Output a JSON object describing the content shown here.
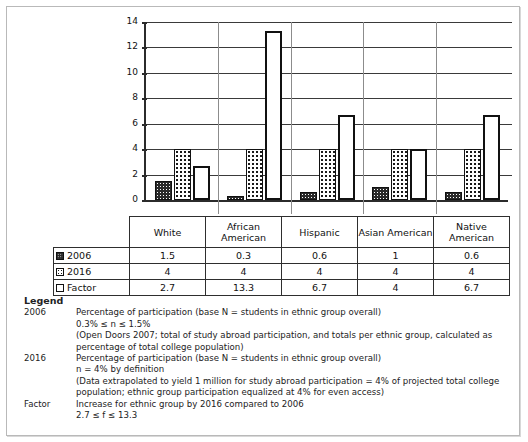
{
  "chart_data": {
    "type": "bar",
    "title": "",
    "xlabel": "",
    "ylabel": "",
    "ylim": [
      0,
      14
    ],
    "yticks": [
      0,
      2,
      4,
      6,
      8,
      10,
      12,
      14
    ],
    "grid": true,
    "legend_position": "table-row-headers",
    "categories": [
      "White",
      "African American",
      "Hispanic",
      "Asian American",
      "Native American"
    ],
    "series": [
      {
        "name": "2006",
        "values": [
          1.5,
          0.3,
          0.6,
          1,
          0.6
        ]
      },
      {
        "name": "2016",
        "values": [
          4,
          4,
          4,
          4,
          4
        ]
      },
      {
        "name": "Factor",
        "values": [
          2.7,
          13.3,
          6.7,
          4,
          6.7
        ]
      }
    ]
  },
  "table": {
    "column_headers": [
      "White",
      "African American",
      "Hispanic",
      "Asian American",
      "Native American"
    ],
    "rows": [
      {
        "label": "2006",
        "swatch": "swatch-2006-icon",
        "values": [
          "1.5",
          "0.3",
          "0.6",
          "1",
          "0.6"
        ]
      },
      {
        "label": "2016",
        "swatch": "swatch-2016-icon",
        "values": [
          "4",
          "4",
          "4",
          "4",
          "4"
        ]
      },
      {
        "label": "Factor",
        "swatch": "swatch-factor-icon",
        "values": [
          "2.7",
          "13.3",
          "6.7",
          "4",
          "6.7"
        ]
      }
    ]
  },
  "legend": {
    "title": "Legend",
    "entries": [
      {
        "key": "2006",
        "lines": [
          "Percentage of participation (base N = students in ethnic group overall)",
          "0.3% ≤ n ≤ 1.5%",
          "(Open Doors 2007; total of study abroad participation, and totals per ethnic group, calculated as",
          "percentage of total college population)"
        ]
      },
      {
        "key": "2016",
        "lines": [
          "Percentage of participation (base N = students in ethnic group overall)",
          "n = 4% by definition",
          "(Data extrapolated to yield 1 million for study abroad participation = 4% of projected total college",
          "population; ethnic group participation equalized at 4% for even access)"
        ]
      },
      {
        "key": "Factor",
        "lines": [
          "Increase for ethnic group by 2016 compared to 2006",
          "2.7 ≤ f ≤ 13.3"
        ]
      }
    ]
  }
}
